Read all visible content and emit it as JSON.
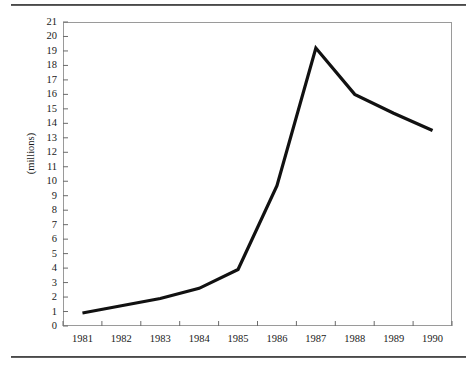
{
  "figure": {
    "background_color": "#ffffff",
    "rule_color": "#2b2b2b",
    "plot_border_color": "#9a9a9a",
    "series_color": "#111111"
  },
  "axes": {
    "y_axis_title": "(millions)",
    "y_tick_labels": [
      "21",
      "20",
      "19",
      "18",
      "17",
      "16",
      "15",
      "14",
      "13",
      "12",
      "11",
      "10",
      "9",
      "8",
      "7",
      "6",
      "5",
      "4",
      "3",
      "2",
      "1",
      "0"
    ],
    "x_tick_labels": [
      "1981",
      "1982",
      "1983",
      "1984",
      "1985",
      "1986",
      "1987",
      "1988",
      "1989",
      "1990"
    ]
  },
  "chart_data": {
    "type": "line",
    "title": "",
    "subtitle": "",
    "xlabel": "",
    "ylabel": "(millions)",
    "categories": [
      "1981",
      "1982",
      "1983",
      "1984",
      "1985",
      "1986",
      "1987",
      "1988",
      "1989",
      "1990"
    ],
    "x": [
      1981,
      1982,
      1983,
      1984,
      1985,
      1986,
      1987,
      1988,
      1989,
      1990
    ],
    "values": [
      0.9,
      1.4,
      1.9,
      2.6,
      3.9,
      9.7,
      19.2,
      16.0,
      14.7,
      13.5
    ],
    "series": [
      {
        "name": "",
        "values": [
          0.9,
          1.4,
          1.9,
          2.6,
          3.9,
          9.7,
          19.2,
          16.0,
          14.7,
          13.5
        ]
      }
    ],
    "xlim": [
      1981,
      1990
    ],
    "ylim": [
      0,
      21
    ],
    "y_ticks": [
      0,
      1,
      2,
      3,
      4,
      5,
      6,
      7,
      8,
      9,
      10,
      11,
      12,
      13,
      14,
      15,
      16,
      17,
      18,
      19,
      20,
      21
    ],
    "grid": false,
    "legend": "none",
    "annotations": []
  }
}
